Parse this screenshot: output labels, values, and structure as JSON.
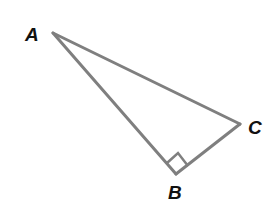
{
  "diagram": {
    "colors": {
      "stroke": "#7f7f7f",
      "label": "#111111",
      "background": "#ffffff"
    },
    "vertices": {
      "A": {
        "label": "A",
        "x": 53,
        "y": 33
      },
      "B": {
        "label": "B",
        "x": 176,
        "y": 174
      },
      "C": {
        "label": "C",
        "x": 240,
        "y": 124
      }
    },
    "right_angle_at": "B",
    "labels": {
      "A": "A",
      "B": "B",
      "C": "C"
    }
  }
}
